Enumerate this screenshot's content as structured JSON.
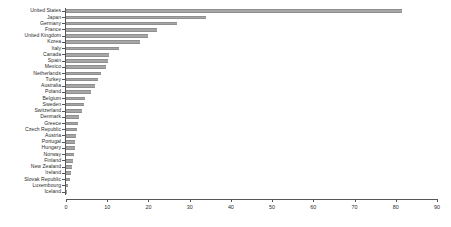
{
  "chart_data": {
    "type": "bar",
    "orientation": "horizontal",
    "title": "",
    "subtitle": "",
    "xlabel": "",
    "ylabel": "",
    "xlim": [
      0,
      90
    ],
    "ylim": null,
    "grid": false,
    "legend": null,
    "xticks": [
      0,
      10,
      20,
      30,
      40,
      50,
      60,
      70,
      80,
      90
    ],
    "bar_color": "#a6a6a6",
    "axis_color": "#555555",
    "text_color": "#2b2b2b",
    "background": "#ffffff",
    "categories": [
      "United States",
      "Japan",
      "Germany",
      "France",
      "United Kingdom",
      "Korea",
      "Italy",
      "Canada",
      "Spain",
      "Mexico",
      "Netherlands",
      "Turkey",
      "Australia",
      "Poland",
      "Belgium",
      "Sweden",
      "Switzerland",
      "Denmark",
      "Greece",
      "Czech Republic",
      "Austria",
      "Portugal",
      "Hungary",
      "Norway",
      "Finland",
      "New Zealand",
      "Ireland",
      "Slovak Republic",
      "Luxembourg",
      "Iceland"
    ],
    "values": [
      81.5,
      34.0,
      27.0,
      22.0,
      20.0,
      18.0,
      12.8,
      10.5,
      10.2,
      9.7,
      8.6,
      7.8,
      7.0,
      6.0,
      4.6,
      4.3,
      3.8,
      3.2,
      2.9,
      2.6,
      2.4,
      2.2,
      2.1,
      1.9,
      1.7,
      1.5,
      1.2,
      1.0,
      0.5,
      0.2
    ]
  }
}
